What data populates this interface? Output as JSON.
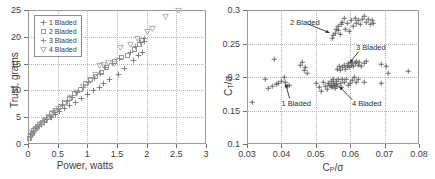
{
  "figure": {
    "panels": [
      "left-scatter-thrust-power",
      "right-scatter-ct-cp"
    ]
  },
  "chart_data": [
    {
      "id": "left",
      "type": "scatter",
      "title": "",
      "xlabel": "Power, watts",
      "ylabel": "Trust, grams",
      "xlim": [
        0,
        3
      ],
      "ylim": [
        0,
        25
      ],
      "xticks": [
        "0",
        "0.5",
        "1",
        "1.5",
        "2",
        "2.5",
        "3"
      ],
      "xtick_values": [
        0,
        0.5,
        1,
        1.5,
        2,
        2.5,
        3
      ],
      "yticks": [
        "0",
        "5",
        "10",
        "15",
        "20",
        "25"
      ],
      "ytick_values": [
        0,
        5,
        10,
        15,
        20,
        25
      ],
      "grid": true,
      "legend_position": "upper-left",
      "series": [
        {
          "name": "1 Bladed",
          "marker": "plus",
          "color": "#6f6f6f",
          "points": [
            [
              0.04,
              1.3
            ],
            [
              0.06,
              1.8
            ],
            [
              0.09,
              2.2
            ],
            [
              0.12,
              2.6
            ],
            [
              0.15,
              3.0
            ],
            [
              0.19,
              3.3
            ],
            [
              0.23,
              3.7
            ],
            [
              0.28,
              4.1
            ],
            [
              0.33,
              4.5
            ],
            [
              0.39,
              5.0
            ],
            [
              0.46,
              5.5
            ],
            [
              0.53,
              6.0
            ],
            [
              0.61,
              6.6
            ],
            [
              0.7,
              7.1
            ],
            [
              0.8,
              7.8
            ],
            [
              0.9,
              8.4
            ],
            [
              1.0,
              9.2
            ],
            [
              1.1,
              10.0
            ],
            [
              1.2,
              10.6
            ],
            [
              1.28,
              11.3
            ],
            [
              1.38,
              12.0
            ],
            [
              1.52,
              13.0
            ],
            [
              1.62,
              14.0
            ],
            [
              1.78,
              15.6
            ],
            [
              1.86,
              16.5
            ],
            [
              1.93,
              17.0
            ],
            [
              1.96,
              19.1
            ]
          ]
        },
        {
          "name": "2 Bladed",
          "marker": "square-open",
          "color": "#9a9a9a",
          "points": [
            [
              0.03,
              1.1
            ],
            [
              0.05,
              1.6
            ],
            [
              0.07,
              2.0
            ],
            [
              0.1,
              2.5
            ],
            [
              0.13,
              2.9
            ],
            [
              0.16,
              3.2
            ],
            [
              0.2,
              3.6
            ],
            [
              0.24,
              4.0
            ],
            [
              0.29,
              4.5
            ],
            [
              0.34,
              5.0
            ],
            [
              0.4,
              5.6
            ],
            [
              0.47,
              6.3
            ],
            [
              0.54,
              7.0
            ],
            [
              0.62,
              7.7
            ],
            [
              0.7,
              8.5
            ],
            [
              0.79,
              9.4
            ],
            [
              0.88,
              10.2
            ],
            [
              0.97,
              11.2
            ],
            [
              1.05,
              12.0
            ],
            [
              1.14,
              12.6
            ],
            [
              1.24,
              13.4
            ],
            [
              1.33,
              14.3
            ],
            [
              1.45,
              15.3
            ],
            [
              1.58,
              16.2
            ],
            [
              1.68,
              16.6
            ],
            [
              1.8,
              17.6
            ],
            [
              1.88,
              18.6
            ],
            [
              1.92,
              19.4
            ]
          ]
        },
        {
          "name": "3 Bladed",
          "marker": "plus",
          "color": "#7f7f7f",
          "points": [
            [
              0.04,
              1.4
            ],
            [
              0.07,
              1.9
            ],
            [
              0.1,
              2.4
            ],
            [
              0.14,
              2.8
            ],
            [
              0.18,
              3.2
            ],
            [
              0.22,
              3.6
            ],
            [
              0.27,
              4.1
            ],
            [
              0.32,
              4.6
            ],
            [
              0.38,
              5.2
            ],
            [
              0.44,
              5.8
            ],
            [
              0.51,
              6.5
            ],
            [
              0.58,
              7.2
            ],
            [
              0.66,
              7.9
            ],
            [
              0.75,
              8.7
            ],
            [
              0.84,
              9.6
            ],
            [
              0.93,
              10.5
            ],
            [
              1.02,
              11.4
            ],
            [
              1.12,
              12.3
            ],
            [
              1.22,
              13.2
            ],
            [
              1.31,
              14.2
            ],
            [
              1.42,
              15.1
            ],
            [
              1.54,
              15.9
            ],
            [
              1.72,
              17.1
            ],
            [
              1.82,
              18.1
            ],
            [
              1.9,
              18.9
            ],
            [
              1.96,
              19.6
            ]
          ]
        },
        {
          "name": "4 Bladed",
          "marker": "triangle-down-open",
          "color": "#9a9a9a",
          "points": [
            [
              0.05,
              1.5
            ],
            [
              0.08,
              2.1
            ],
            [
              0.12,
              2.7
            ],
            [
              0.17,
              3.2
            ],
            [
              0.22,
              3.8
            ],
            [
              0.28,
              4.4
            ],
            [
              0.35,
              5.1
            ],
            [
              0.43,
              5.9
            ],
            [
              0.52,
              6.7
            ],
            [
              0.61,
              7.6
            ],
            [
              0.71,
              8.6
            ],
            [
              0.82,
              9.6
            ],
            [
              0.93,
              10.7
            ],
            [
              1.05,
              11.9
            ],
            [
              1.14,
              13.0
            ],
            [
              1.2,
              14.6
            ],
            [
              1.28,
              14.8
            ],
            [
              1.36,
              15.2
            ],
            [
              1.46,
              15.1
            ],
            [
              1.56,
              18.0
            ],
            [
              1.72,
              18.5
            ],
            [
              1.84,
              19.7
            ],
            [
              2.02,
              21.0
            ],
            [
              2.1,
              21.6
            ],
            [
              2.32,
              23.8
            ],
            [
              2.54,
              25.0
            ]
          ]
        }
      ]
    },
    {
      "id": "right",
      "type": "scatter",
      "title": "",
      "xlabel": "C_P/σ",
      "xlabel_parts": {
        "c": "C",
        "sub": "P",
        "rest": "/σ"
      },
      "ylabel": "C_T/σ",
      "ylabel_parts": {
        "c": "C",
        "sub": "T",
        "rest": "/σ"
      },
      "xlim": [
        0.03,
        0.08
      ],
      "ylim": [
        0.1,
        0.3
      ],
      "xticks": [
        "0.03",
        "0.04",
        "0.05",
        "0.06",
        "0.07",
        "0.08"
      ],
      "xtick_values": [
        0.03,
        0.04,
        0.05,
        0.06,
        0.07,
        0.08
      ],
      "yticks": [
        "0.1",
        "0.15",
        "0.2",
        "0.25",
        "0.3"
      ],
      "ytick_values": [
        0.1,
        0.15,
        0.2,
        0.25,
        0.3
      ],
      "grid": true,
      "marker": "plus",
      "color": "#4a4a4a",
      "points": [
        [
          0.0315,
          0.163
        ],
        [
          0.0352,
          0.196
        ],
        [
          0.0362,
          0.183
        ],
        [
          0.0372,
          0.186
        ],
        [
          0.0378,
          0.227
        ],
        [
          0.0385,
          0.189
        ],
        [
          0.0392,
          0.19
        ],
        [
          0.04,
          0.193
        ],
        [
          0.0408,
          0.199
        ],
        [
          0.0412,
          0.192
        ],
        [
          0.0418,
          0.186
        ],
        [
          0.0424,
          0.188
        ],
        [
          0.0455,
          0.218
        ],
        [
          0.0462,
          0.222
        ],
        [
          0.0466,
          0.21
        ],
        [
          0.047,
          0.214
        ],
        [
          0.0476,
          0.206
        ],
        [
          0.0502,
          0.19
        ],
        [
          0.051,
          0.184
        ],
        [
          0.0517,
          0.179
        ],
        [
          0.0522,
          0.192
        ],
        [
          0.0528,
          0.186
        ],
        [
          0.0532,
          0.182
        ],
        [
          0.0536,
          0.19
        ],
        [
          0.054,
          0.188
        ],
        [
          0.0544,
          0.193
        ],
        [
          0.0546,
          0.186
        ],
        [
          0.0548,
          0.184
        ],
        [
          0.055,
          0.191
        ],
        [
          0.0552,
          0.196
        ],
        [
          0.0554,
          0.187
        ],
        [
          0.0556,
          0.183
        ],
        [
          0.0558,
          0.189
        ],
        [
          0.056,
          0.193
        ],
        [
          0.0562,
          0.186
        ],
        [
          0.0566,
          0.196
        ],
        [
          0.057,
          0.19
        ],
        [
          0.0574,
          0.184
        ],
        [
          0.0578,
          0.197
        ],
        [
          0.0582,
          0.192
        ],
        [
          0.0588,
          0.196
        ],
        [
          0.0594,
          0.188
        ],
        [
          0.06,
          0.191
        ],
        [
          0.0606,
          0.195
        ],
        [
          0.0612,
          0.199
        ],
        [
          0.0618,
          0.192
        ],
        [
          0.0624,
          0.196
        ],
        [
          0.064,
          0.192
        ],
        [
          0.069,
          0.19
        ],
        [
          0.0548,
          0.258
        ],
        [
          0.0552,
          0.262
        ],
        [
          0.0556,
          0.266
        ],
        [
          0.056,
          0.272
        ],
        [
          0.0564,
          0.27
        ],
        [
          0.0566,
          0.276
        ],
        [
          0.057,
          0.264
        ],
        [
          0.0574,
          0.278
        ],
        [
          0.0578,
          0.282
        ],
        [
          0.0582,
          0.287
        ],
        [
          0.0586,
          0.272
        ],
        [
          0.059,
          0.28
        ],
        [
          0.0596,
          0.268
        ],
        [
          0.0602,
          0.284
        ],
        [
          0.0608,
          0.276
        ],
        [
          0.0614,
          0.288
        ],
        [
          0.0618,
          0.28
        ],
        [
          0.0622,
          0.284
        ],
        [
          0.0628,
          0.278
        ],
        [
          0.0634,
          0.286
        ],
        [
          0.064,
          0.29
        ],
        [
          0.0646,
          0.282
        ],
        [
          0.0652,
          0.286
        ],
        [
          0.0658,
          0.278
        ],
        [
          0.0664,
          0.284
        ],
        [
          0.0668,
          0.28
        ],
        [
          0.0562,
          0.212
        ],
        [
          0.0568,
          0.216
        ],
        [
          0.0572,
          0.21
        ],
        [
          0.0578,
          0.214
        ],
        [
          0.0582,
          0.218
        ],
        [
          0.0586,
          0.212
        ],
        [
          0.059,
          0.216
        ],
        [
          0.0594,
          0.22
        ],
        [
          0.0598,
          0.214
        ],
        [
          0.0602,
          0.218
        ],
        [
          0.0606,
          0.222
        ],
        [
          0.061,
          0.216
        ],
        [
          0.0614,
          0.22
        ],
        [
          0.0618,
          0.224
        ],
        [
          0.0622,
          0.218
        ],
        [
          0.0626,
          0.222
        ],
        [
          0.0632,
          0.216
        ],
        [
          0.064,
          0.22
        ],
        [
          0.0648,
          0.224
        ],
        [
          0.069,
          0.219
        ],
        [
          0.0706,
          0.216
        ],
        [
          0.0712,
          0.206
        ],
        [
          0.077,
          0.209
        ]
      ],
      "annotations": [
        {
          "label": "2 Bladed",
          "text_x": 0.0425,
          "text_y": 0.281,
          "arrow_from_x": 0.0478,
          "arrow_from_y": 0.279,
          "arrow_to_x": 0.054,
          "arrow_to_y": 0.266
        },
        {
          "label": "3 Bladed",
          "text_x": 0.0617,
          "text_y": 0.243,
          "arrow_from_x": 0.0625,
          "arrow_from_y": 0.238,
          "arrow_to_x": 0.0598,
          "arrow_to_y": 0.221
        },
        {
          "label": "1 Bladed",
          "text_x": 0.04,
          "text_y": 0.159,
          "arrow_from_x": 0.0424,
          "arrow_from_y": 0.168,
          "arrow_to_x": 0.0412,
          "arrow_to_y": 0.19
        },
        {
          "label": "4 Bladed",
          "text_x": 0.0605,
          "text_y": 0.159,
          "arrow_from_x": 0.0606,
          "arrow_from_y": 0.166,
          "arrow_to_x": 0.0568,
          "arrow_to_y": 0.186
        }
      ]
    }
  ]
}
